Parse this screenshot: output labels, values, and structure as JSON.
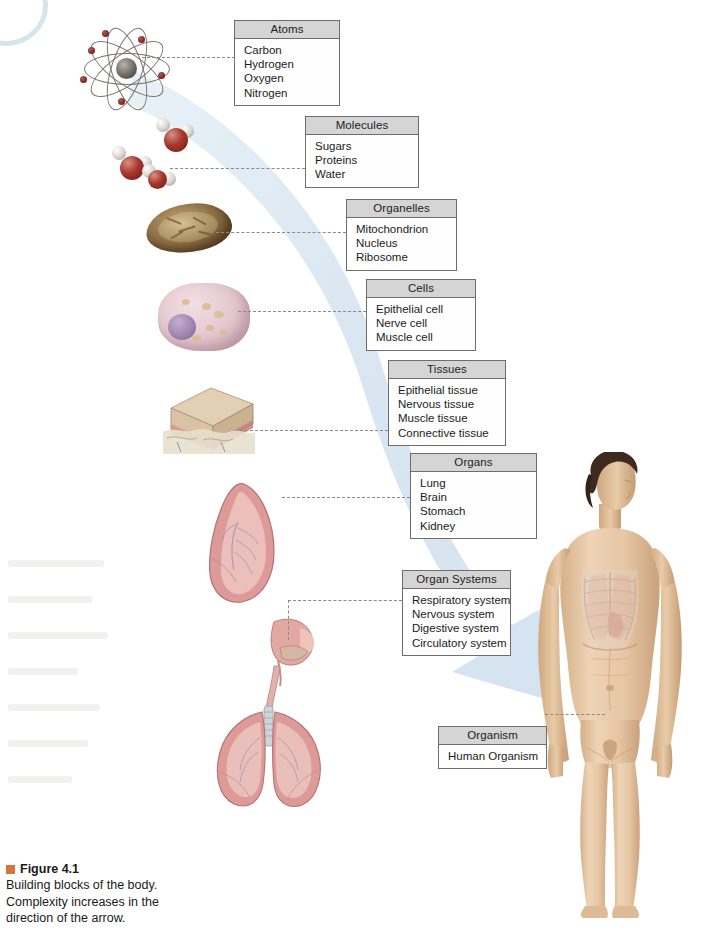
{
  "figure": {
    "number_label": "Figure 4.1",
    "caption_line1": "Building blocks of the body.",
    "caption_line2": "Complexity increases in the",
    "caption_line3": "direction of the arrow.",
    "bullet_color": "#d4763a"
  },
  "colors": {
    "box_header_bg": "#d5d5d5",
    "box_border": "#6d6d6d",
    "box_body_bg": "#fefefe",
    "arrow_fill": "#c9dcea",
    "leader_line": "#8a8a8a",
    "text": "#1c1c1c"
  },
  "levels": [
    {
      "key": "atoms",
      "title": "Atoms",
      "items": [
        "Carbon",
        "Hydrogen",
        "Oxygen",
        "Nitrogen"
      ],
      "illustration": "atom-illustration"
    },
    {
      "key": "molecules",
      "title": "Molecules",
      "items": [
        "Sugars",
        "Proteins",
        "Water"
      ],
      "illustration": "water-molecules-illustration"
    },
    {
      "key": "organelles",
      "title": "Organelles",
      "items": [
        "Mitochondrion",
        "Nucleus",
        "Ribosome"
      ],
      "illustration": "mitochondrion-illustration"
    },
    {
      "key": "cells",
      "title": "Cells",
      "items": [
        "Epithelial cell",
        "Nerve cell",
        "Muscle cell"
      ],
      "illustration": "cell-illustration"
    },
    {
      "key": "tissues",
      "title": "Tissues",
      "items": [
        "Epithelial tissue",
        "Nervous tissue",
        "Muscle tissue",
        "Connective tissue"
      ],
      "illustration": "tissue-block-illustration"
    },
    {
      "key": "organs",
      "title": "Organs",
      "items": [
        "Lung",
        "Brain",
        "Stomach",
        "Kidney"
      ],
      "illustration": "lung-illustration"
    },
    {
      "key": "organ_systems",
      "title": "Organ Systems",
      "items": [
        "Respiratory system",
        "Nervous system",
        "Digestive system",
        "Circulatory system"
      ],
      "illustration": "respiratory-system-illustration"
    },
    {
      "key": "organism",
      "title": "Organism",
      "items": [
        "Human Organism"
      ],
      "illustration": "human-body-illustration"
    }
  ]
}
